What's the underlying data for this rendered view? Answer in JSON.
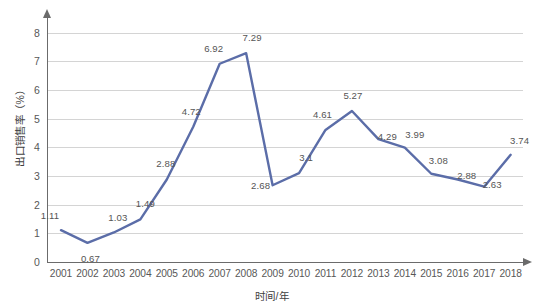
{
  "chart_data": {
    "type": "line",
    "title": "",
    "xlabel": "时间/年",
    "ylabel": "出口销售率（%）",
    "categories": [
      "2001",
      "2002",
      "2003",
      "2004",
      "2005",
      "2006",
      "2007",
      "2008",
      "2009",
      "2010",
      "2011",
      "2012",
      "2013",
      "2014",
      "2015",
      "2016",
      "2017",
      "2018"
    ],
    "values": [
      1.11,
      0.67,
      1.03,
      1.49,
      2.88,
      4.72,
      6.92,
      7.29,
      2.68,
      3.1,
      4.61,
      5.27,
      4.29,
      3.99,
      3.08,
      2.88,
      2.63,
      3.74
    ],
    "point_labels": [
      "1.11",
      "0.67",
      "1.03",
      "1.49",
      "2.88",
      "4.72",
      "6.92",
      "7.29",
      "2.68",
      "3.1",
      "4.61",
      "5.27",
      "4.29",
      "3.99",
      "3.08",
      "2.88",
      "2.63",
      "3.74"
    ],
    "ylim": [
      0,
      8
    ],
    "yticks": [
      "0",
      "1",
      "2",
      "3",
      "4",
      "5",
      "6",
      "7",
      "8"
    ],
    "grid": true,
    "legend": "none",
    "series_color": "#5b6da8",
    "grid_color": "#d4d4d4",
    "axis_color": "#6b6b6b",
    "label_color": "#555555",
    "markers": false
  },
  "axis": {
    "y_title": "出口销售率（%）",
    "x_title": "时间/年"
  }
}
